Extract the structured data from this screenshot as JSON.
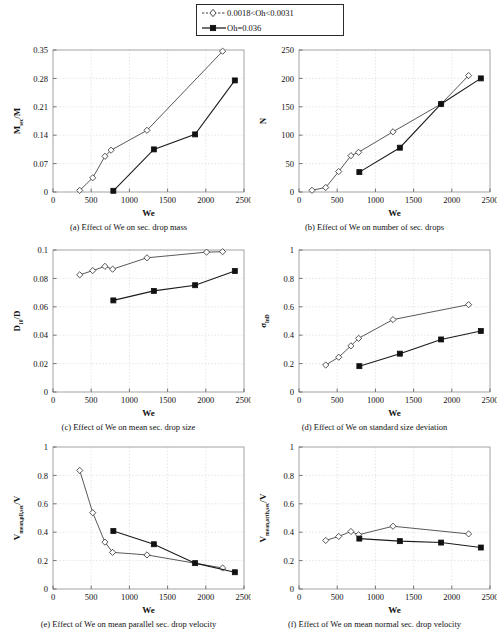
{
  "figure": {
    "legend": {
      "entries": [
        {
          "label": "0.0018<Oh<0.0031",
          "marker": "open-diamond-icon",
          "line": "dashed"
        },
        {
          "label": "Oh=0.036",
          "marker": "filled-square-icon",
          "line": "solid"
        }
      ]
    },
    "shared": {
      "xlabel": "We",
      "xlim": [
        0,
        2500
      ],
      "xticks": [
        0,
        500,
        1000,
        1500,
        2000,
        2500
      ],
      "series_names": [
        "0.0018<Oh<0.0031",
        "Oh=0.036"
      ]
    }
  },
  "chart_data": [
    {
      "id": "a",
      "type": "line",
      "title": "(a) Effect of We on sec. drop mass",
      "xlabel": "We",
      "ylabel": "M_sec/M",
      "ylabel_parts": {
        "base": "M",
        "sub": "sec",
        "tail": "/M"
      },
      "xlim": [
        0,
        2500
      ],
      "ylim": [
        0,
        0.35
      ],
      "xticks": [
        0,
        500,
        1000,
        1500,
        2000,
        2500
      ],
      "yticks": [
        0,
        0.07,
        0.14,
        0.21,
        0.28,
        0.35
      ],
      "ytick_labels": [
        "0",
        "0.07",
        "0.14",
        "0.21",
        "0.28",
        "0.35"
      ],
      "grid": true,
      "series": [
        {
          "name": "0.0018<Oh<0.0031",
          "x": [
            350,
            520,
            680,
            760,
            1230,
            2220
          ],
          "y": [
            0.004,
            0.035,
            0.088,
            0.103,
            0.152,
            0.347
          ]
        },
        {
          "name": "Oh=0.036",
          "x": [
            790,
            1320,
            1860,
            2380
          ],
          "y": [
            0.003,
            0.105,
            0.142,
            0.275
          ]
        }
      ]
    },
    {
      "id": "b",
      "type": "line",
      "title": "(b) Effect of We on number of sec. drops",
      "xlabel": "We",
      "ylabel": "N",
      "xlim": [
        0,
        2500
      ],
      "ylim": [
        0,
        250
      ],
      "xticks": [
        0,
        500,
        1000,
        1500,
        2000,
        2500
      ],
      "yticks": [
        0,
        50,
        100,
        150,
        200,
        250
      ],
      "ytick_labels": [
        "0",
        "50",
        "100",
        "150",
        "200",
        "250"
      ],
      "grid": true,
      "series": [
        {
          "name": "0.0018<Oh<0.0031",
          "x": [
            170,
            350,
            520,
            680,
            780,
            1230,
            1860,
            2220
          ],
          "y": [
            3,
            8,
            36,
            64,
            70,
            106,
            155,
            205
          ]
        },
        {
          "name": "Oh=0.036",
          "x": [
            790,
            1320,
            1860,
            2380
          ],
          "y": [
            35,
            78,
            155,
            200
          ]
        }
      ]
    },
    {
      "id": "c",
      "type": "line",
      "title": "(c) Effect of We on mean sec. drop size",
      "xlabel": "We",
      "ylabel": "D10/D",
      "ylabel_parts": {
        "base": "D",
        "sub": "10",
        "tail": "/D"
      },
      "xlim": [
        0,
        2500
      ],
      "ylim": [
        0,
        0.1
      ],
      "xticks": [
        0,
        500,
        1000,
        1500,
        2000,
        2500
      ],
      "yticks": [
        0,
        0.02,
        0.04,
        0.06,
        0.08,
        0.1
      ],
      "ytick_labels": [
        "0",
        "0.02",
        "0.04",
        "0.06",
        "0.08",
        "0.1"
      ],
      "grid": true,
      "series": [
        {
          "name": "0.0018<Oh<0.0031",
          "x": [
            350,
            520,
            680,
            780,
            1230,
            2010,
            2220
          ],
          "y": [
            0.0825,
            0.0855,
            0.0885,
            0.0865,
            0.0945,
            0.0985,
            0.0988
          ]
        },
        {
          "name": "Oh=0.036",
          "x": [
            790,
            1320,
            1860,
            2380
          ],
          "y": [
            0.0645,
            0.0712,
            0.0752,
            0.0852
          ]
        }
      ]
    },
    {
      "id": "d",
      "type": "line",
      "title": "(d) Effect of We on standard size deviation",
      "xlabel": "We",
      "ylabel": "sigma_lnD",
      "ylabel_parts": {
        "base": "σ",
        "sub": "lnD",
        "tail": ""
      },
      "xlim": [
        0,
        2500
      ],
      "ylim": [
        0,
        1
      ],
      "xticks": [
        0,
        500,
        1000,
        1500,
        2000,
        2500
      ],
      "yticks": [
        0,
        0.2,
        0.4,
        0.6,
        0.8,
        1
      ],
      "ytick_labels": [
        "0",
        "0.2",
        "0.4",
        "0.6",
        "0.8",
        "1"
      ],
      "grid": true,
      "series": [
        {
          "name": "0.0018<Oh<0.0031",
          "x": [
            350,
            520,
            680,
            780,
            1230,
            2220
          ],
          "y": [
            0.19,
            0.245,
            0.325,
            0.378,
            0.51,
            0.615
          ]
        },
        {
          "name": "Oh=0.036",
          "x": [
            790,
            1320,
            1860,
            2380
          ],
          "y": [
            0.182,
            0.27,
            0.37,
            0.43
          ]
        }
      ]
    },
    {
      "id": "e",
      "type": "line",
      "title": "(e) Effect of We on mean parallel sec. drop velocity",
      "xlabel": "We",
      "ylabel": "V_mean,pll,sec/V",
      "ylabel_parts": {
        "base": "V",
        "sub": "mean,pll,sec",
        "tail": "/V"
      },
      "xlim": [
        0,
        2500
      ],
      "ylim": [
        0,
        1
      ],
      "xticks": [
        0,
        500,
        1000,
        1500,
        2000,
        2500
      ],
      "yticks": [
        0,
        0.2,
        0.4,
        0.6,
        0.8,
        1
      ],
      "ytick_labels": [
        "0",
        "0.2",
        "0.4",
        "0.6",
        "0.8",
        "1"
      ],
      "grid": true,
      "series": [
        {
          "name": "0.0018<Oh<0.0031",
          "x": [
            350,
            520,
            680,
            780,
            1230,
            2220
          ],
          "y": [
            0.835,
            0.537,
            0.33,
            0.258,
            0.24,
            0.148
          ]
        },
        {
          "name": "Oh=0.036",
          "x": [
            790,
            1320,
            1860,
            2380
          ],
          "y": [
            0.408,
            0.315,
            0.182,
            0.118
          ]
        }
      ]
    },
    {
      "id": "f",
      "type": "line",
      "title": "(f) Effect of We on mean normal sec. drop velocity",
      "xlabel": "We",
      "ylabel": "V_mean,orth,sec/V",
      "ylabel_parts": {
        "base": "V",
        "sub": "mean,orth,sec",
        "tail": "/V"
      },
      "xlim": [
        0,
        2500
      ],
      "ylim": [
        0,
        1
      ],
      "xticks": [
        0,
        500,
        1000,
        1500,
        2000,
        2500
      ],
      "yticks": [
        0,
        0.2,
        0.4,
        0.6,
        0.8,
        1
      ],
      "ytick_labels": [
        "0",
        "0.2",
        "0.4",
        "0.6",
        "0.8",
        "1"
      ],
      "grid": true,
      "series": [
        {
          "name": "0.0018<Oh<0.0031",
          "x": [
            350,
            520,
            680,
            780,
            1230,
            2220
          ],
          "y": [
            0.342,
            0.37,
            0.405,
            0.382,
            0.442,
            0.388
          ]
        },
        {
          "name": "Oh=0.036",
          "x": [
            790,
            1320,
            1860,
            2380
          ],
          "y": [
            0.355,
            0.337,
            0.327,
            0.292
          ]
        }
      ]
    }
  ]
}
